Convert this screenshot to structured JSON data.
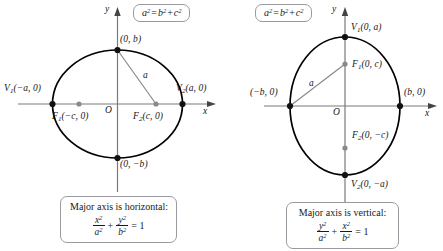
{
  "figure": {
    "background_color": "#ffffff",
    "curve_color": "#000000",
    "axis_color": "#7a7a7a",
    "vertex_dot_color": "#111111",
    "focus_dot_color": "#8a8a8a",
    "segment_color": "#8a8a8a",
    "box_border_color": "#9a9aa0"
  },
  "panels": [
    {
      "id": "horizontal-major-axis",
      "identity": {
        "lhs": "a",
        "lhs_exp": "2",
        "eq": "=",
        "t1": "b",
        "t1_exp": "2",
        "plus": "+",
        "t2": "c",
        "t2_exp": "2",
        "full": "a² = b² + c²"
      },
      "axes": {
        "x_label": "x",
        "y_label": "y",
        "origin_label": "O"
      },
      "points": [
        {
          "name": "covertex-top",
          "label": "(0, b)",
          "type": "vertex"
        },
        {
          "name": "covertex-bottom",
          "label": "(0, −b)",
          "type": "vertex"
        },
        {
          "name": "vertex-left",
          "label_v": "V",
          "label_sub": "1",
          "label_rest": "(−a, 0)",
          "type": "vertex"
        },
        {
          "name": "vertex-right",
          "label_v": "V",
          "label_sub": "2",
          "label_rest": "(a, 0)",
          "type": "vertex"
        },
        {
          "name": "focus-left",
          "label_v": "F",
          "label_sub": "1",
          "label_rest": "(−c, 0)",
          "type": "focus"
        },
        {
          "name": "focus-right",
          "label_v": "F",
          "label_sub": "2",
          "label_rest": "(c, 0)",
          "type": "focus"
        }
      ],
      "segment_label": "a",
      "caption": {
        "text": "Major axis is horizontal:",
        "num1": "x",
        "den1": "a",
        "num2": "y",
        "den2": "b",
        "plus": "+",
        "equals": "= 1"
      }
    },
    {
      "id": "vertical-major-axis",
      "identity": {
        "lhs": "a",
        "lhs_exp": "2",
        "eq": "=",
        "t1": "b",
        "t1_exp": "2",
        "plus": "+",
        "t2": "c",
        "t2_exp": "2",
        "full": "a² = b² + c²"
      },
      "axes": {
        "x_label": "x",
        "y_label": "y",
        "origin_label": "O"
      },
      "points": [
        {
          "name": "vertex-top",
          "label_v": "V",
          "label_sub": "1",
          "label_rest": "(0, a)",
          "type": "vertex"
        },
        {
          "name": "vertex-bottom",
          "label_v": "V",
          "label_sub": "2",
          "label_rest": "(0, −a)",
          "type": "vertex"
        },
        {
          "name": "covertex-left",
          "label": "(−b, 0)",
          "type": "vertex"
        },
        {
          "name": "covertex-right",
          "label": "(b, 0)",
          "type": "vertex"
        },
        {
          "name": "focus-top",
          "label_v": "F",
          "label_sub": "1",
          "label_rest": "(0, c)",
          "type": "focus"
        },
        {
          "name": "focus-bottom",
          "label_v": "F",
          "label_sub": "2",
          "label_rest": "(0, −c)",
          "type": "focus"
        }
      ],
      "segment_label": "a",
      "caption": {
        "text": "Major axis is vertical:",
        "num1": "y",
        "den1": "a",
        "num2": "x",
        "den2": "b",
        "plus": "+",
        "equals": "= 1"
      }
    }
  ]
}
